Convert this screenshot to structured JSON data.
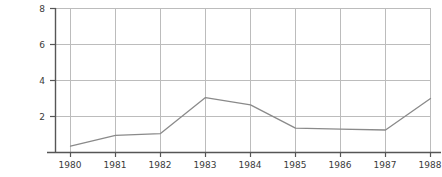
{
  "chart_data": {
    "type": "line",
    "title": "",
    "subtitle": "",
    "xlabel": "",
    "ylabel": "",
    "categories": [
      "1980",
      "1981",
      "1982",
      "1983",
      "1984",
      "1985",
      "1986",
      "1987",
      "1988"
    ],
    "x": [
      1980,
      1981,
      1982,
      1983,
      1984,
      1985,
      1986,
      1987,
      1988
    ],
    "values": [
      0.35,
      0.95,
      1.05,
      3.05,
      2.65,
      1.35,
      1.3,
      1.25,
      3.0
    ],
    "series": [
      {
        "name": "",
        "values": [
          0.35,
          0.95,
          1.05,
          3.05,
          2.65,
          1.35,
          1.3,
          1.25,
          3.0
        ]
      }
    ],
    "xlim": [
      1979.67,
      1988.0
    ],
    "ylim": [
      0,
      8
    ],
    "ytick_labels": [
      "2",
      "4",
      "6",
      "8"
    ],
    "ytick_values": [
      2,
      4,
      6,
      8
    ],
    "xtick_labels": [
      "1980",
      "1981",
      "1982",
      "1983",
      "1984",
      "1985",
      "1986",
      "1987",
      "1988"
    ],
    "grid": "horizontal-and-vertical",
    "legend": "none",
    "annotations": [],
    "colors": {
      "line": "#8a8a8a",
      "grid": "#bcbcbc",
      "axis": "#565656",
      "text": "#3a3a3a",
      "background": "#ffffff"
    }
  },
  "plot": {
    "left_px": 55,
    "right_px": 430,
    "top_px": 8,
    "baseline_px": 152,
    "px_per_unit": 18,
    "x_first_tick_px": 70,
    "x_tick_spacing_px": 45
  }
}
